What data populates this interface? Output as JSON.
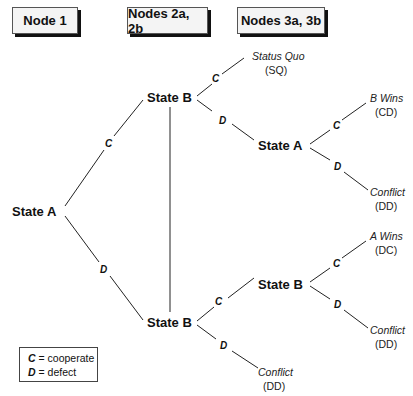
{
  "headers": {
    "node1": "Node 1",
    "node2": "Nodes 2a, 2b",
    "node3": "Nodes 3a, 3b"
  },
  "nodes": {
    "root": "State A",
    "top_b": "State B",
    "bottom_b": "State B",
    "top_a": "State A",
    "bottom_b2": "State B"
  },
  "moves": {
    "c": "C",
    "d": "D"
  },
  "outcomes": {
    "sq_label": "Status Quo",
    "sq_code": "(SQ)",
    "bwins_label": "B  Wins",
    "bwins_code": "(CD)",
    "conflict1_label": "Conflict",
    "conflict1_code": "(DD)",
    "awins_label": "A  Wins",
    "awins_code": "(DC)",
    "conflict2_label": "Conflict",
    "conflict2_code": "(DD)",
    "conflict3_label": "Conflict",
    "conflict3_code": "(DD)"
  },
  "legend": {
    "c_key": "C",
    "c_text": " = cooperate",
    "d_key": "D",
    "d_text": " = defect"
  }
}
